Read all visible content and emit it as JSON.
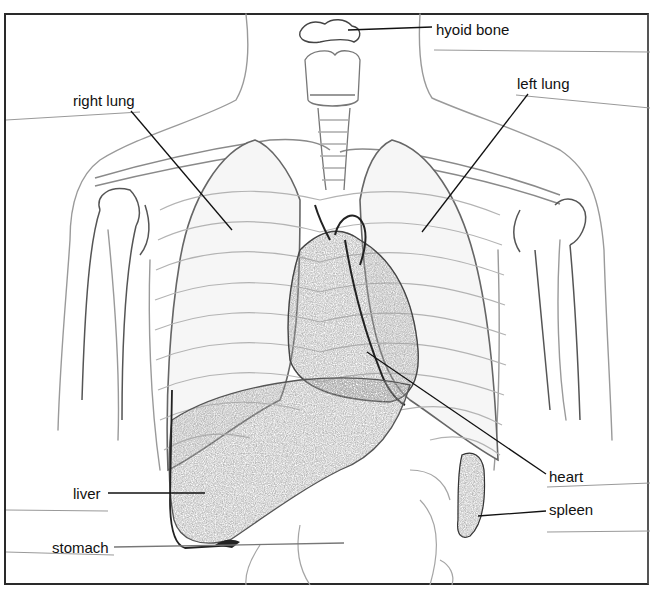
{
  "diagram": {
    "type": "anatomical line drawing",
    "labels": [
      {
        "id": "hyoid-bone",
        "text": "hyoid bone",
        "x": 436,
        "y": 22
      },
      {
        "id": "right-lung",
        "text": "right lung",
        "x": 73,
        "y": 93
      },
      {
        "id": "left-lung",
        "text": "left lung",
        "x": 517,
        "y": 76
      },
      {
        "id": "heart",
        "text": "heart",
        "x": 549,
        "y": 469
      },
      {
        "id": "liver",
        "text": "liver",
        "x": 73,
        "y": 486
      },
      {
        "id": "spleen",
        "text": "spleen",
        "x": 549,
        "y": 502
      },
      {
        "id": "stomach",
        "text": "stomach",
        "x": 52,
        "y": 540
      }
    ],
    "answer_lines": [
      {
        "x1": 434,
        "y1": 50,
        "x2": 650,
        "y2": 52
      },
      {
        "x1": 6,
        "y1": 120,
        "x2": 140,
        "y2": 112
      },
      {
        "x1": 516,
        "y1": 95,
        "x2": 650,
        "y2": 108
      },
      {
        "x1": 6,
        "y1": 510,
        "x2": 108,
        "y2": 511
      },
      {
        "x1": 6,
        "y1": 552,
        "x2": 114,
        "y2": 555
      },
      {
        "x1": 547,
        "y1": 487,
        "x2": 650,
        "y2": 483
      },
      {
        "x1": 547,
        "y1": 532,
        "x2": 650,
        "y2": 531
      }
    ],
    "leader_lines": [
      {
        "to": "hyoid-bone",
        "x1": 348,
        "y1": 30,
        "x2": 432,
        "y2": 27
      },
      {
        "to": "right-lung",
        "x1": 131,
        "y1": 111,
        "x2": 232,
        "y2": 230
      },
      {
        "to": "left-lung",
        "x1": 528,
        "y1": 94,
        "x2": 422,
        "y2": 232
      },
      {
        "to": "heart",
        "x1": 367,
        "y1": 352,
        "x2": 546,
        "y2": 474
      },
      {
        "to": "liver",
        "x1": 108,
        "y1": 493,
        "x2": 205,
        "y2": 493
      },
      {
        "to": "spleen",
        "x1": 478,
        "y1": 516,
        "x2": 546,
        "y2": 511
      },
      {
        "to": "stomach",
        "x1": 114,
        "y1": 547,
        "x2": 344,
        "y2": 543
      }
    ],
    "colors": {
      "ink": "#111111",
      "sketch": "#8a8a8a",
      "shading": "#9a9a9a",
      "frame": "#2a2a2a"
    }
  }
}
